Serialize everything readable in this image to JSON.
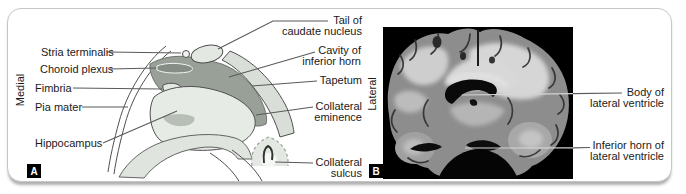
{
  "panel_a": {
    "badge": "A",
    "side_label": "Medial",
    "labels": {
      "stria_terminalis": "Stria terminalis",
      "choroid_plexus": "Choroid plexus",
      "fimbria": "Fimbria",
      "pia_mater": "Pia mater",
      "hippocampus": "Hippocampus",
      "tail_of_caudate": "Tail of\ncaudate nucleus",
      "cavity_inferior_horn": "Cavity of\ninferior horn",
      "tapetum": "Tapetum",
      "collateral_eminence": "Collateral\neminence",
      "collateral_sulcus": "Collateral\nsulcus"
    }
  },
  "panel_b": {
    "badge": "B",
    "side_label": "Lateral",
    "labels": {
      "body_lateral_ventricle": "Body of\nlateral ventricle",
      "inferior_horn_lateral_ventricle": "Inferior horn of\nlateral ventricle"
    }
  },
  "colors": {
    "leader": "#5a5a5a",
    "diagram_light": "#e3e8e2",
    "diagram_band": "#d9dfd8",
    "diagram_dark": "#98a098",
    "photo_background": "#000000"
  }
}
